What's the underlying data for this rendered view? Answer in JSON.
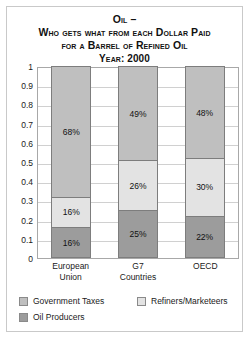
{
  "title": {
    "line1": "Oil –",
    "line2": "Who gets what from each Dollar Paid",
    "line3": "for a Barrel of Refined Oil",
    "line4": "Year: 2000"
  },
  "chart_data": {
    "type": "bar",
    "subtype": "stacked-100",
    "title": "Oil – Who gets what from each Dollar Paid for a Barrel of Refined Oil Year: 2000",
    "xlabel": "",
    "ylabel": "",
    "ylim": [
      0,
      1
    ],
    "grid": true,
    "legend_position": "bottom",
    "categories": [
      "European Union",
      "G7 Countries",
      "OECD"
    ],
    "category_lines": [
      [
        "European",
        "Union"
      ],
      [
        "G7",
        "Countries"
      ],
      [
        "OECD"
      ]
    ],
    "yticks": [
      "1",
      "0.9",
      "0.8",
      "0.7",
      "0.6",
      "0.5",
      "0.4",
      "0.3",
      "0.2",
      "0.1",
      "0"
    ],
    "ytick_values": [
      1,
      0.9,
      0.8,
      0.7,
      0.6,
      0.5,
      0.4,
      0.3,
      0.2,
      0.1,
      0
    ],
    "series": [
      {
        "name": "Government Taxes",
        "color": "#bfbfbf",
        "values": [
          0.68,
          0.49,
          0.48
        ],
        "labels": [
          "68%",
          "49%",
          "48%"
        ]
      },
      {
        "name": "Refiners/Marketeers",
        "color": "#e3e3e3",
        "values": [
          0.16,
          0.26,
          0.3
        ],
        "labels": [
          "16%",
          "26%",
          "30%"
        ]
      },
      {
        "name": "Oil Producers",
        "color": "#9c9c9c",
        "values": [
          0.16,
          0.25,
          0.22
        ],
        "labels": [
          "16%",
          "25%",
          "22%"
        ]
      }
    ]
  },
  "legend": [
    {
      "label": "Government Taxes",
      "color": "#bfbfbf"
    },
    {
      "label": "Refiners/Marketeers",
      "color": "#e3e3e3"
    },
    {
      "label": "Oil Producers",
      "color": "#9c9c9c"
    }
  ]
}
